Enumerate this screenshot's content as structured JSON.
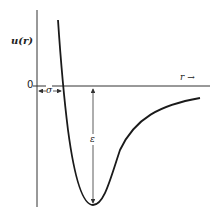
{
  "diagram": {
    "y_label": "u(r)",
    "x_label": "r →",
    "zero_label": "0",
    "sigma_label": "σ",
    "epsilon_label": "ε",
    "colors": {
      "line": "#1a1a1a",
      "axis": "#333333",
      "background": "#ffffff"
    }
  }
}
